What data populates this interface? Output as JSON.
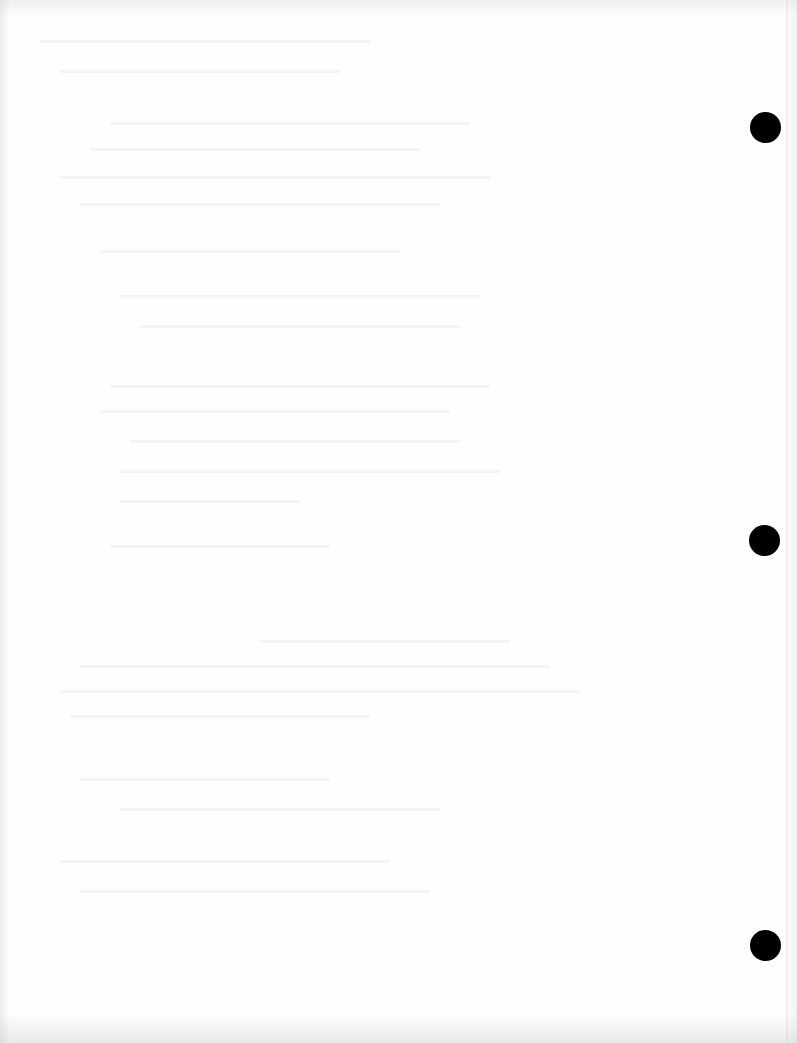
{
  "document": {
    "type": "scanned blank page (reverse side)",
    "description": "Mostly blank paper with faint illegible show-through text and three binder punch holes along the right edge",
    "background_color": "#fefefe",
    "hole_color": "#000000",
    "visible_text": ""
  },
  "punch_holes": [
    {
      "name": "top",
      "cx": 765,
      "cy": 127,
      "r": 15
    },
    {
      "name": "middle",
      "cx": 764,
      "cy": 540,
      "r": 15
    },
    {
      "name": "bottom",
      "cx": 765,
      "cy": 945,
      "r": 15
    }
  ],
  "bleed_through_lines": [
    {
      "x": 40,
      "y": 40,
      "w": 330
    },
    {
      "x": 60,
      "y": 70,
      "w": 280
    },
    {
      "x": 110,
      "y": 122,
      "w": 360
    },
    {
      "x": 90,
      "y": 148,
      "w": 330
    },
    {
      "x": 60,
      "y": 176,
      "w": 430
    },
    {
      "x": 80,
      "y": 203,
      "w": 360
    },
    {
      "x": 100,
      "y": 250,
      "w": 300
    },
    {
      "x": 120,
      "y": 295,
      "w": 360
    },
    {
      "x": 140,
      "y": 325,
      "w": 320
    },
    {
      "x": 110,
      "y": 385,
      "w": 380
    },
    {
      "x": 100,
      "y": 410,
      "w": 350
    },
    {
      "x": 130,
      "y": 440,
      "w": 330
    },
    {
      "x": 120,
      "y": 470,
      "w": 380
    },
    {
      "x": 120,
      "y": 500,
      "w": 180
    },
    {
      "x": 110,
      "y": 545,
      "w": 220
    },
    {
      "x": 260,
      "y": 640,
      "w": 250
    },
    {
      "x": 80,
      "y": 665,
      "w": 470
    },
    {
      "x": 60,
      "y": 690,
      "w": 520
    },
    {
      "x": 70,
      "y": 715,
      "w": 300
    },
    {
      "x": 80,
      "y": 778,
      "w": 250
    },
    {
      "x": 120,
      "y": 808,
      "w": 320
    },
    {
      "x": 60,
      "y": 860,
      "w": 330
    },
    {
      "x": 80,
      "y": 890,
      "w": 350
    }
  ]
}
